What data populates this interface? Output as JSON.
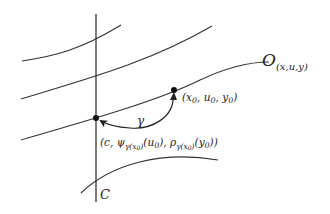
{
  "diagram": {
    "colors": {
      "stroke": "#333333",
      "text": "#222222",
      "background": "#ffffff"
    },
    "vertical_line": {
      "label": "C",
      "x": 96,
      "y1": 14,
      "y2": 202
    },
    "curves": [
      {
        "id": "curve-1",
        "path": "M22,61 C55,56 80,50 121,25"
      },
      {
        "id": "curve-2",
        "path": "M21,99 C90,78 150,62 212,26"
      },
      {
        "id": "curve-3-orbit",
        "path": "M21,140 C90,120 160,100 200,80 C230,66 250,62 269,62",
        "label": "O_(x,u,y)"
      },
      {
        "id": "curve-4",
        "path": "M81,193 C110,165 160,150 218,160"
      }
    ],
    "points": [
      {
        "id": "point-c",
        "x": 96,
        "y": 118,
        "label": "(c, ψ_γ(x0)(u0), ρ_γ(x0)(y0))"
      },
      {
        "id": "point-x0",
        "x": 174,
        "y": 90,
        "label": "(x0, u0, y0)"
      }
    ],
    "arrow": {
      "label": "γ",
      "path": "M173,95 C175,118 150,130 130,128 C115,127 106,124 101,121"
    },
    "labels": {
      "orbit_main": "O",
      "orbit_sub": "(x,u,y)",
      "point_x0_text": "(x",
      "gamma": "γ",
      "curve_c": "C",
      "point_c_parts": {
        "open": "(c, ψ",
        "sub1": "γ(x",
        "sub1_0": "0",
        "sub1_close": ")",
        "arg1": "(u",
        "arg1_0": "0",
        "mid": "), ρ",
        "sub2": "γ(x",
        "sub2_0": "0",
        "sub2_close": ")",
        "arg2": "(y",
        "arg2_0": "0",
        "close": "))"
      },
      "point_x0_parts": {
        "open": "(x",
        "x_sub": "0",
        "u": ", u",
        "u_sub": "0",
        "y": ", y",
        "y_sub": "0",
        "close": ")"
      }
    }
  }
}
